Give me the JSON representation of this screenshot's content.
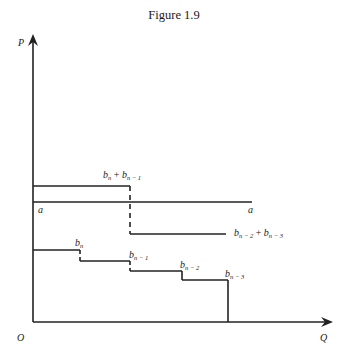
{
  "figure": {
    "title": "Figure 1.9",
    "axes": {
      "y_label": "P",
      "x_label": "Q",
      "origin_label": "O"
    },
    "line_a": {
      "left_label": "a",
      "right_label": "a"
    },
    "labels": {
      "sum_top": {
        "b1": "b",
        "s1": "n",
        "plus": "+",
        "b2": "b",
        "s2": "n − 1"
      },
      "sum_bottom": {
        "b1": "b",
        "s1": "n − 2",
        "plus": "+",
        "b2": "b",
        "s2": "n − 3"
      },
      "step1": {
        "b": "b",
        "s": "n"
      },
      "step2": {
        "b": "b",
        "s": "n − 1"
      },
      "step3": {
        "b": "b",
        "s": "n − 2"
      },
      "step4": {
        "b": "b",
        "s": "n − 3"
      }
    }
  }
}
